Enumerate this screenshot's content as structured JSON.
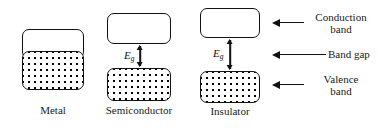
{
  "figure": {
    "background": "#ffffff",
    "line_color": "#111111",
    "dot_color": "#000000"
  },
  "diagrams": [
    {
      "id": "metal",
      "caption": "Metal",
      "description": "overlapping conduction and valence bands, no band gap",
      "bands": [
        {
          "name": "conduction-band",
          "fill": "empty"
        },
        {
          "name": "valence-band",
          "fill": "dotted"
        }
      ],
      "band_gap": null
    },
    {
      "id": "semiconductor",
      "caption": "Semiconductor",
      "description": "small band gap between conduction and valence bands",
      "bands": [
        {
          "name": "conduction-band",
          "fill": "empty"
        },
        {
          "name": "valence-band",
          "fill": "dotted"
        }
      ],
      "band_gap": {
        "symbol": "E",
        "subscript": "g",
        "size": "small"
      }
    },
    {
      "id": "insulator",
      "caption": "Insulator",
      "description": "large band gap between conduction and valence bands",
      "bands": [
        {
          "name": "conduction-band",
          "fill": "empty"
        },
        {
          "name": "valence-band",
          "fill": "dotted"
        }
      ],
      "band_gap": {
        "symbol": "E",
        "subscript": "g",
        "size": "large"
      }
    }
  ],
  "callouts": [
    {
      "id": "conduction-band",
      "text": "Conduction\nband"
    },
    {
      "id": "band-gap",
      "text": "Band gap"
    },
    {
      "id": "valence-band",
      "text": "Valence\nband"
    }
  ]
}
